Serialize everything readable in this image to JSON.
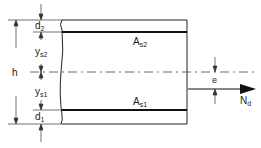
{
  "diagram": {
    "labels": {
      "d2": "d",
      "d2_sub": "2",
      "ys2": "y",
      "ys2_sub": "s2",
      "h": "h",
      "ys1": "y",
      "ys1_sub": "s1",
      "d1": "d",
      "d1_sub": "1",
      "As2": "A",
      "As2_sub": "s2",
      "As1": "A",
      "As1_sub": "s1",
      "e": "e",
      "Nd": "N",
      "Nd_sub": "d"
    },
    "colors": {
      "line": "#222222",
      "background": "#ffffff"
    }
  }
}
